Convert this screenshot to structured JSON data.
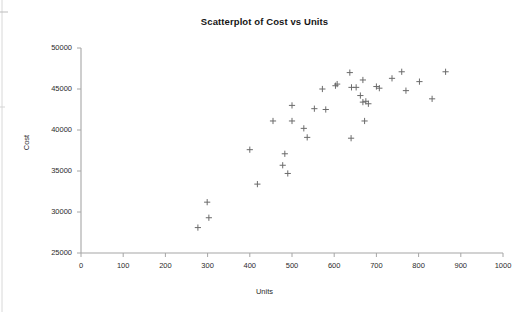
{
  "chart_data": {
    "type": "scatter",
    "title": "Scatterplot of Cost vs Units",
    "xlabel": "Units",
    "ylabel": "Cost",
    "xlim": [
      0,
      1000
    ],
    "ylim": [
      25000,
      50000
    ],
    "xticks": [
      0,
      100,
      200,
      300,
      400,
      500,
      600,
      700,
      800,
      900,
      1000
    ],
    "yticks": [
      25000,
      30000,
      35000,
      40000,
      45000,
      50000
    ],
    "xtick_labels": [
      "0",
      "100",
      "200",
      "300",
      "400",
      "500",
      "600",
      "700",
      "800",
      "900",
      "1000"
    ],
    "ytick_labels": [
      "25000",
      "30000",
      "35000",
      "40000",
      "45000",
      "50000"
    ],
    "grid": false,
    "legend": false,
    "marker": "plus",
    "marker_color": "#6b6b6b",
    "axis_color": "#a6a6a6",
    "series": [
      {
        "name": "Cost vs Units",
        "points": [
          [
            277,
            28100
          ],
          [
            303,
            29300
          ],
          [
            299,
            31200
          ],
          [
            418,
            33400
          ],
          [
            400,
            37600
          ],
          [
            490,
            34700
          ],
          [
            478,
            35700
          ],
          [
            483,
            37100
          ],
          [
            455,
            41100
          ],
          [
            500,
            41100
          ],
          [
            500,
            43000
          ],
          [
            528,
            40200
          ],
          [
            536,
            39100
          ],
          [
            553,
            42600
          ],
          [
            572,
            45000
          ],
          [
            580,
            42500
          ],
          [
            603,
            45400
          ],
          [
            607,
            45600
          ],
          [
            640,
            39000
          ],
          [
            637,
            47000
          ],
          [
            641,
            45200
          ],
          [
            652,
            45200
          ],
          [
            668,
            46100
          ],
          [
            662,
            44200
          ],
          [
            668,
            43400
          ],
          [
            675,
            43500
          ],
          [
            681,
            43200
          ],
          [
            672,
            41100
          ],
          [
            700,
            45300
          ],
          [
            707,
            45100
          ],
          [
            737,
            46300
          ],
          [
            760,
            47100
          ],
          [
            770,
            44800
          ],
          [
            802,
            45900
          ],
          [
            832,
            43800
          ],
          [
            864,
            47100
          ]
        ]
      }
    ]
  },
  "axes": {
    "y_title": "Cost",
    "x_title": "Units"
  }
}
